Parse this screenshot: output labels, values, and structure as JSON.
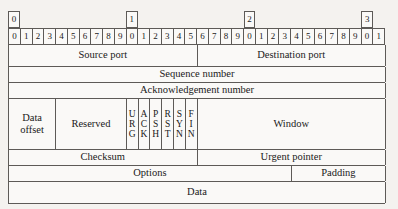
{
  "diagram": {
    "bit_width": 32,
    "decade_markers": [
      {
        "label": "0",
        "bit": 0
      },
      {
        "label": "1",
        "bit": 10
      },
      {
        "label": "2",
        "bit": 20
      },
      {
        "label": "3",
        "bit": 30
      }
    ],
    "bit_labels": [
      "0",
      "1",
      "2",
      "3",
      "4",
      "5",
      "6",
      "7",
      "8",
      "9",
      "0",
      "1",
      "2",
      "3",
      "4",
      "5",
      "6",
      "7",
      "8",
      "9",
      "0",
      "1",
      "2",
      "3",
      "4",
      "5",
      "6",
      "7",
      "8",
      "9",
      "0",
      "1"
    ],
    "rows": [
      {
        "name": "ports",
        "fields": [
          {
            "label": "Source port",
            "bits": 16
          },
          {
            "label": "Destination port",
            "bits": 16
          }
        ]
      },
      {
        "name": "sequence",
        "fields": [
          {
            "label": "Sequence number",
            "bits": 32
          }
        ]
      },
      {
        "name": "acknowledgement",
        "fields": [
          {
            "label": "Acknowledgement number",
            "bits": 32
          }
        ]
      },
      {
        "name": "offset-flags-window",
        "fields": [
          {
            "label": "Data offset",
            "bits": 4
          },
          {
            "label": "Reserved",
            "bits": 6
          },
          {
            "label": "URG",
            "bits": 1,
            "stacked": true
          },
          {
            "label": "ACK",
            "bits": 1,
            "stacked": true
          },
          {
            "label": "PSH",
            "bits": 1,
            "stacked": true
          },
          {
            "label": "RST",
            "bits": 1,
            "stacked": true
          },
          {
            "label": "SYN",
            "bits": 1,
            "stacked": true
          },
          {
            "label": "FIN",
            "bits": 1,
            "stacked": true
          },
          {
            "label": "Window",
            "bits": 16
          }
        ]
      },
      {
        "name": "checksum-urgent",
        "fields": [
          {
            "label": "Checksum",
            "bits": 16
          },
          {
            "label": "Urgent pointer",
            "bits": 16
          }
        ]
      },
      {
        "name": "options-padding",
        "fields": [
          {
            "label": "Options",
            "bits": 24
          },
          {
            "label": "Padding",
            "bits": 8
          }
        ]
      },
      {
        "name": "data",
        "fields": [
          {
            "label": "Data",
            "bits": 32
          }
        ]
      }
    ]
  }
}
